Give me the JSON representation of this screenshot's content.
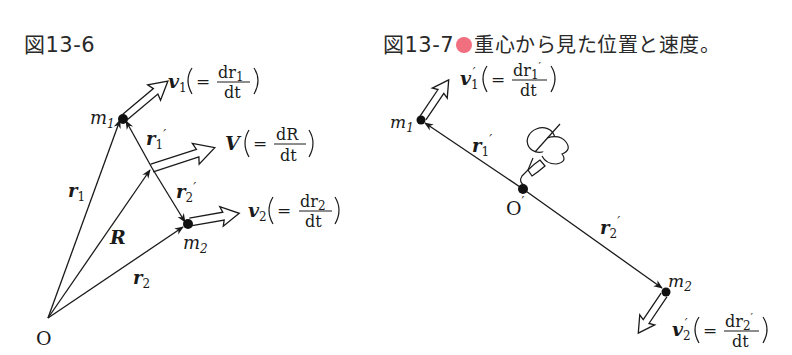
{
  "figures": [
    {
      "id_label": "図13-6",
      "caption": "",
      "labels": {
        "origin": "O",
        "m1": "m",
        "m1_sub": "1",
        "m2": "m",
        "m2_sub": "2",
        "r1": "r",
        "r1_sub": "1",
        "r2": "r",
        "r2_sub": "2",
        "R": "R",
        "r1p": "r",
        "r1p_sub": "1",
        "r2p": "r",
        "r2p_sub": "2",
        "prime": "′",
        "v1": "v",
        "v1_sub": "1",
        "v1_num": "dr",
        "v1_num_sub": "1",
        "v2": "v",
        "v2_sub": "2",
        "v2_num": "dr",
        "v2_num_sub": "2",
        "V": "V",
        "V_num": "dR",
        "den": "dt",
        "eq": "="
      }
    },
    {
      "id_label": "図13-7",
      "caption": "重心から見た位置と速度。",
      "bullet_color": "#f07080",
      "labels": {
        "origin": "O",
        "prime": "′",
        "m1": "m",
        "m1_sub": "1",
        "m2": "m",
        "m2_sub": "2",
        "r1p": "r",
        "r1p_sub": "1",
        "r2p": "r",
        "r2p_sub": "2",
        "v1p": "v",
        "v1p_sub": "1",
        "v1p_num": "dr",
        "v1p_num_sub": "1",
        "v2p": "v",
        "v2p_sub": "2",
        "v2p_num": "dr",
        "v2p_num_sub": "2",
        "den": "dt",
        "eq": "="
      }
    }
  ]
}
